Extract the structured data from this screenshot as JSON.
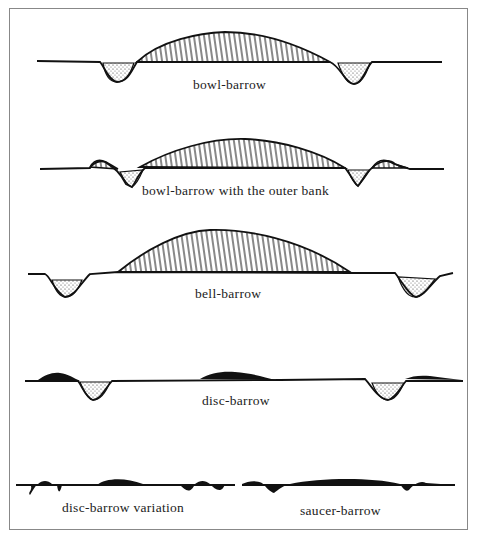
{
  "diagram": {
    "sections": [
      {
        "id": "bowl-barrow",
        "label": "bowl-barrow"
      },
      {
        "id": "bowl-barrow-outer-bank",
        "label": "bowl-barrow with the outer bank"
      },
      {
        "id": "bell-barrow",
        "label": "bell-barrow"
      },
      {
        "id": "disc-barrow",
        "label": "disc-barrow"
      },
      {
        "id": "disc-barrow-variation",
        "label": "disc-barrow variation"
      },
      {
        "id": "saucer-barrow",
        "label": "saucer-barrow"
      }
    ],
    "colors": {
      "ink": "#111111",
      "frame": "#888888",
      "background": "#ffffff"
    }
  }
}
